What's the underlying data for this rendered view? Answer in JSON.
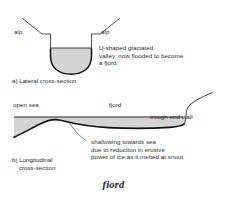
{
  "figure": {
    "title": "fiord",
    "panels": [
      {
        "id": "lateral",
        "caption": "a) Lateral cross-section",
        "labels": {
          "alp_left": "alp",
          "alp_right": "alp",
          "annotation": "U-shaped glaciated\nvalley, now flooded to become\na fjord"
        }
      },
      {
        "id": "longitudinal",
        "caption": "b) Longitudinal\n    cross-section",
        "labels": {
          "open_sea": "open sea",
          "fjord": "fjord",
          "trough_end_wall": "trough end wall",
          "annotation": "shallowing towards sea\ndue to reduction in erosive\npower of ice as it melted at snout"
        }
      }
    ],
    "colors": {
      "rock_fill": "#d4d4d4",
      "outline": "#111111",
      "leader": "#4a4a4a",
      "text": "#2b2b2b",
      "background": "#ffffff"
    }
  }
}
